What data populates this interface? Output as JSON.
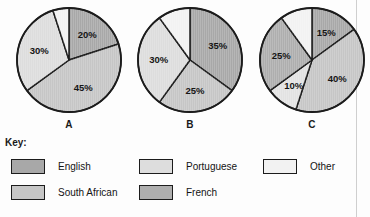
{
  "page": {
    "key_title": "Key:"
  },
  "chart_data": [
    {
      "type": "pie",
      "id": "A",
      "title": "A",
      "caption": "A",
      "start_angle_deg": 0,
      "direction": "clockwise",
      "categories": [
        "English",
        "South African",
        "Portuguese",
        "Other"
      ],
      "values": [
        20,
        45,
        30,
        5
      ],
      "labels": [
        "20%",
        "45%",
        "30%",
        ""
      ],
      "colors": [
        "#a8a8a8",
        "#c6c6c6",
        "#dddddd",
        "#f2f2f2"
      ],
      "unit": "%"
    },
    {
      "type": "pie",
      "id": "B",
      "title": "B",
      "caption": "B",
      "start_angle_deg": 0,
      "direction": "clockwise",
      "categories": [
        "English",
        "South African",
        "Portuguese",
        "Other"
      ],
      "values": [
        35,
        25,
        30,
        10
      ],
      "labels": [
        "35%",
        "25%",
        "30%",
        ""
      ],
      "colors": [
        "#a8a8a8",
        "#c6c6c6",
        "#dddddd",
        "#f2f2f2"
      ],
      "unit": "%"
    },
    {
      "type": "pie",
      "id": "C",
      "title": "C",
      "caption": "C",
      "start_angle_deg": 0,
      "direction": "clockwise",
      "categories": [
        "English",
        "South African",
        "Portuguese",
        "French",
        "Other"
      ],
      "values": [
        15,
        40,
        10,
        25,
        10
      ],
      "labels": [
        "15%",
        "40%",
        "10%",
        "25%",
        ""
      ],
      "colors": [
        "#a8a8a8",
        "#c6c6c6",
        "#e2e2e2",
        "#aeaeae",
        "#f2f2f2"
      ],
      "unit": "%"
    }
  ],
  "legend": {
    "position": "bottom",
    "items": [
      {
        "label": "English",
        "color": "#a8a8a8"
      },
      {
        "label": "South African",
        "color": "#c6c6c6"
      },
      {
        "label": "Portuguese",
        "color": "#dddddd"
      },
      {
        "label": "French",
        "color": "#aeaeae"
      },
      {
        "label": "Other",
        "color": "#f2f2f2"
      }
    ]
  },
  "style": {
    "outline_color": "#1c1c1c",
    "background": "#fdfdfd"
  }
}
